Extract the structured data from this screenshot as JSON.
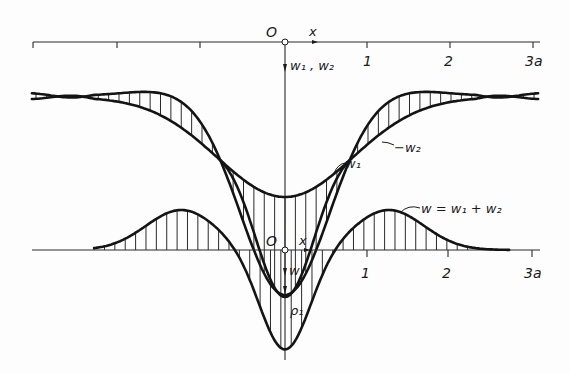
{
  "figure": {
    "upper_panel": {
      "origin_label": "O",
      "x_axis_label": "x",
      "y_axis_label": "w₁ , w₂",
      "tick_labels": [
        "1",
        "2",
        "3a"
      ],
      "curve_labels": {
        "w1": "w₁",
        "minus_w2": "−w₂"
      }
    },
    "lower_panel": {
      "origin_label": "O",
      "x_axis_label": "x",
      "y_axis_label": "w",
      "tick_labels": [
        "1",
        "2",
        "3a"
      ],
      "curve_label": "w = w₁ + w₂",
      "radius_label": "ρ₁"
    },
    "colors": {
      "ink": "#141414",
      "paper": "#fdfdfd"
    }
  },
  "chart_data": [
    {
      "type": "line",
      "title": "Components w1 and -w2",
      "xlabel": "x",
      "ylabel": "w1, w2",
      "x_unit": "a",
      "xlim": [
        -3,
        3
      ],
      "x": [
        -3,
        -2.5,
        -2.3,
        -2,
        -1.5,
        -1,
        -0.65,
        -0.5,
        0,
        0.5,
        0.65,
        1,
        1.5,
        2,
        2.3,
        2.5,
        3
      ],
      "series": [
        {
          "name": "w1",
          "values": [
            0.05,
            0.02,
            0,
            -0.03,
            -0.05,
            0.35,
            0.85,
            1.05,
            1.3,
            1.05,
            0.85,
            0.35,
            -0.05,
            -0.03,
            0,
            0.02,
            0.05
          ]
        },
        {
          "name": "-w2",
          "values": [
            -0.05,
            -0.02,
            0,
            0.1,
            0.3,
            0.6,
            0.85,
            0.95,
            1.0,
            0.95,
            0.85,
            0.6,
            0.3,
            0.1,
            0,
            -0.02,
            -0.05
          ]
        }
      ],
      "annotations": [
        "shaded (hatched) region between w1 and -w2"
      ]
    },
    {
      "type": "line",
      "title": "Resultant deflection",
      "xlabel": "x",
      "ylabel": "w",
      "x_unit": "a",
      "xlim": [
        -3,
        3
      ],
      "x": [
        -3,
        -2.5,
        -2,
        -1.5,
        -1.25,
        -1,
        -0.5,
        -0.25,
        0,
        0.25,
        0.5,
        1,
        1.25,
        1.5,
        2,
        2.5,
        3
      ],
      "series": [
        {
          "name": "w = w1 + w2",
          "values": [
            0,
            -0.04,
            -0.15,
            -0.33,
            -0.38,
            -0.3,
            0,
            0.45,
            1.0,
            0.45,
            0,
            -0.3,
            -0.38,
            -0.33,
            -0.15,
            -0.04,
            0
          ]
        }
      ],
      "annotations": [
        "w1 repeated dashed-region overlay with radius of curvature ρ₁ at origin",
        "hatched area between w and x-axis"
      ]
    }
  ]
}
